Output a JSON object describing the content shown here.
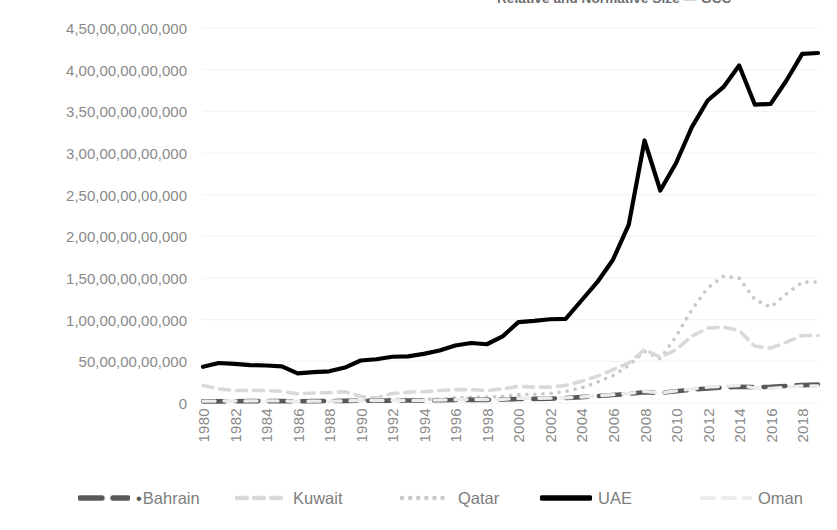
{
  "title_clipped": "Relative and Normative Size — GCC",
  "axis": {
    "y_ticks": [
      "4,50,00,00,00,000",
      "4,00,00,00,00,000",
      "3,50,00,00,00,000",
      "3,00,00,00,00,000",
      "2,50,00,00,00,000",
      "2,00,00,00,00,000",
      "1,50,00,00,00,000",
      "1,00,00,00,00,000",
      "50,00,00,00,000",
      "0"
    ],
    "x_ticks": [
      "1980",
      "1982",
      "1984",
      "1986",
      "1988",
      "1990",
      "1992",
      "1994",
      "1996",
      "1998",
      "2000",
      "2002",
      "2004",
      "2006",
      "2008",
      "2010",
      "2012",
      "2014",
      "2016",
      "2018"
    ]
  },
  "legend": {
    "position": "bottom",
    "items": [
      {
        "label": "Bahrain",
        "marker": "dot-dash",
        "color": "#595959",
        "style": "dashed-thick",
        "prefix_dot": true
      },
      {
        "label": "Kuwait",
        "marker": "dashed",
        "color": "#d9d9d9",
        "style": "dashed-light",
        "prefix_dot": false
      },
      {
        "label": "Qatar",
        "marker": "dotted",
        "color": "#c9c9c9",
        "style": "dotted",
        "prefix_dot": false
      },
      {
        "label": "UAE",
        "marker": "solid",
        "color": "#000000",
        "style": "solid-thick",
        "prefix_dot": false
      },
      {
        "label": "Oman",
        "marker": "dashed",
        "color": "#ececec",
        "style": "dashed-faint",
        "prefix_dot": false
      }
    ]
  },
  "chart_data": {
    "type": "line",
    "title": "Relative and Normative Size — GCC",
    "xlabel": "",
    "ylabel": "",
    "grid": true,
    "legend_position": "bottom",
    "ylim": [
      0,
      45000000000000
    ],
    "ytick_values": [
      45000000000000,
      40000000000000,
      35000000000000,
      30000000000000,
      25000000000000,
      20000000000000,
      15000000000000,
      10000000000000,
      5000000000000,
      0
    ],
    "ytick_labels": [
      "4,50,00,00,00,000",
      "4,00,00,00,00,000",
      "3,50,00,00,00,000",
      "3,00,00,00,00,000",
      "2,50,00,00,00,000",
      "2,00,00,00,00,000",
      "1,50,00,00,00,000",
      "1,00,00,00,00,000",
      "50,00,00,00,000",
      "0"
    ],
    "value_unit": "crore (10,000,000)",
    "x": [
      1980,
      1981,
      1982,
      1983,
      1984,
      1985,
      1986,
      1987,
      1988,
      1989,
      1990,
      1991,
      1992,
      1993,
      1994,
      1995,
      1996,
      1997,
      1998,
      1999,
      2000,
      2001,
      2002,
      2003,
      2004,
      2005,
      2006,
      2007,
      2008,
      2009,
      2010,
      2011,
      2012,
      2013,
      2014,
      2015,
      2016,
      2017,
      2018,
      2019
    ],
    "series": [
      {
        "name": "UAE",
        "color": "#000000",
        "style": "solid",
        "values": [
          4.35,
          4.8,
          4.7,
          4.55,
          4.5,
          4.4,
          3.55,
          3.7,
          3.8,
          4.25,
          5.1,
          5.25,
          5.55,
          5.6,
          5.9,
          6.3,
          6.9,
          7.2,
          7.05,
          8.0,
          9.7,
          9.85,
          10.05,
          10.1,
          12.3,
          14.5,
          17.2,
          21.4,
          31.5,
          25.5,
          28.8,
          33.1,
          36.3,
          37.9,
          40.5,
          35.8,
          35.9,
          38.7,
          41.9,
          42.0
        ]
      },
      {
        "name": "Qatar",
        "color": "#c9c9c9",
        "style": "dotted",
        "values": [
          0.3,
          0.3,
          0.3,
          0.3,
          0.3,
          0.3,
          0.25,
          0.25,
          0.3,
          0.35,
          0.4,
          0.4,
          0.45,
          0.45,
          0.45,
          0.5,
          0.6,
          0.7,
          0.7,
          0.8,
          1.0,
          1.05,
          1.15,
          1.4,
          1.8,
          2.5,
          3.3,
          4.5,
          6.2,
          5.3,
          8.0,
          11.2,
          13.8,
          15.2,
          15.0,
          12.4,
          11.5,
          13.1,
          14.5,
          14.5
        ]
      },
      {
        "name": "Kuwait",
        "color": "#d9d9d9",
        "style": "dashed",
        "values": [
          2.1,
          1.7,
          1.5,
          1.5,
          1.5,
          1.4,
          1.1,
          1.2,
          1.25,
          1.35,
          0.8,
          0.6,
          1.15,
          1.3,
          1.35,
          1.5,
          1.6,
          1.6,
          1.5,
          1.7,
          2.0,
          1.9,
          1.9,
          2.1,
          2.6,
          3.2,
          4.0,
          4.8,
          6.4,
          5.5,
          6.4,
          8.0,
          9.0,
          9.1,
          8.7,
          6.8,
          6.6,
          7.3,
          8.1,
          8.1
        ]
      },
      {
        "name": "Bahrain",
        "color": "#595959",
        "style": "dashed",
        "values": [
          0.2,
          0.2,
          0.2,
          0.22,
          0.22,
          0.22,
          0.21,
          0.22,
          0.24,
          0.26,
          0.28,
          0.27,
          0.29,
          0.3,
          0.31,
          0.33,
          0.36,
          0.38,
          0.38,
          0.42,
          0.48,
          0.5,
          0.52,
          0.6,
          0.7,
          0.82,
          0.95,
          1.1,
          1.3,
          1.2,
          1.4,
          1.6,
          1.75,
          1.85,
          1.95,
          1.9,
          1.95,
          2.05,
          2.15,
          2.2
        ]
      },
      {
        "name": "Oman",
        "color": "#ececec",
        "style": "dashed",
        "values": [
          0.22,
          0.23,
          0.24,
          0.25,
          0.25,
          0.25,
          0.2,
          0.22,
          0.22,
          0.25,
          0.3,
          0.3,
          0.32,
          0.31,
          0.33,
          0.36,
          0.4,
          0.42,
          0.4,
          0.45,
          0.55,
          0.56,
          0.58,
          0.62,
          0.72,
          0.85,
          1.0,
          1.15,
          1.4,
          1.2,
          1.45,
          1.7,
          1.9,
          2.0,
          2.1,
          1.8,
          1.75,
          1.9,
          2.05,
          2.05
        ]
      }
    ]
  }
}
